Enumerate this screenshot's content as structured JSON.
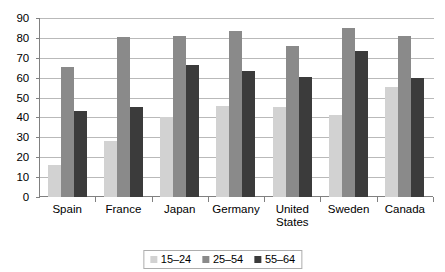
{
  "chart_data": {
    "type": "bar",
    "title": "",
    "subtitle": "",
    "xlabel": "",
    "ylabel": "",
    "ylim": [
      0,
      90
    ],
    "ytick_step": 10,
    "yticks": [
      "0",
      "10",
      "20",
      "30",
      "40",
      "50",
      "60",
      "70",
      "80",
      "90"
    ],
    "grid": true,
    "legend_position": "bottom-center",
    "categories": [
      "Spain",
      "France",
      "Japan",
      "Germany",
      "United\nStates",
      "Sweden",
      "Canada"
    ],
    "series": [
      {
        "name": "15–24",
        "color": "#d2d2d2",
        "values": [
          16,
          28,
          40,
          46,
          45.5,
          41,
          55.5
        ]
      },
      {
        "name": "25–54",
        "color": "#8a8a8a",
        "values": [
          65.5,
          80.5,
          81,
          83.5,
          76,
          85,
          81
        ]
      },
      {
        "name": "55–64",
        "color": "#3b3b3b",
        "values": [
          43,
          45.5,
          66.5,
          63.5,
          60.5,
          73.5,
          60
        ]
      }
    ]
  },
  "colors": {
    "series_15_24": "#d2d2d2",
    "series_25_54": "#8a8a8a",
    "series_55_64": "#3b3b3b",
    "gridline": "#b9b9b9",
    "axis": "#808080",
    "background": "#ffffff",
    "text": "#000000"
  }
}
